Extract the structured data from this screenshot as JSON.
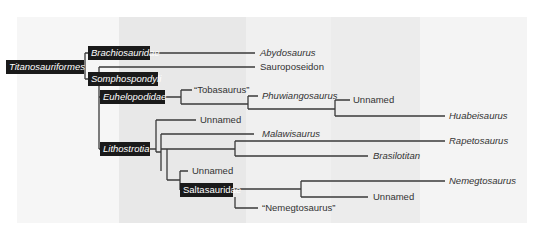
{
  "bands": [
    {
      "x": 17,
      "w": 102,
      "color": "#f6f6f6"
    },
    {
      "x": 119,
      "w": 127,
      "color": "#e8e8e8"
    },
    {
      "x": 246,
      "w": 85,
      "color": "#f0f0f0"
    },
    {
      "x": 331,
      "w": 89,
      "color": "#ececec"
    },
    {
      "x": 420,
      "w": 107,
      "color": "#f4f4f4"
    }
  ],
  "line_color": "#3a3a3a",
  "clades": {
    "titanosauriformes": "Titanosauriformes",
    "brachiosauridae": "Brachiosauridae",
    "somphospondyli": "Somphospondyli",
    "euhelopodidae": "Euhelopodidae",
    "lithostrotia": "Lithostrotia",
    "saltasauridae": "Saltasauridae"
  },
  "taxa": {
    "abydosaurus": "Abydosaurus",
    "sauroposeidon": "Sauroposeidon",
    "tobasaurus": "“Tobasaurus”",
    "phuwiangosaurus": "Phuwiangosaurus",
    "unnamed_1": "Unnamed",
    "huabeisaurus": "Huabeisaurus",
    "unnamed_2": "Unnamed",
    "malawisaurus": "Malawisaurus",
    "rapetosaurus": "Rapetosaurus",
    "brasilotitan": "Brasilotitan",
    "unnamed_3": "Unnamed",
    "nemegtosaurus": "Nemegtosaurus",
    "unnamed_4": "Unnamed",
    "nemegtosaurus_quoted": "“Nemegtosaurus”"
  }
}
